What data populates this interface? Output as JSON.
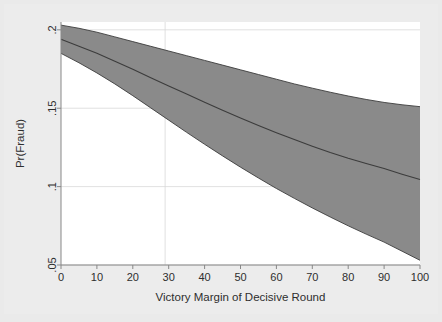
{
  "figure": {
    "background_color": "#ececec",
    "plot_background_color": "#ffffff",
    "band_fill_color": "#8a8a8a",
    "line_color": "#3c3c3c",
    "axis_color": "#888888",
    "gridline_color": "#d8d8d8"
  },
  "chart_data": {
    "type": "line",
    "title": "",
    "subtitle": "",
    "xlabel": "Victory Margin of Decisive Round",
    "ylabel": "Pr(Fraud)",
    "xlim": [
      0,
      100
    ],
    "ylim": [
      0.05,
      0.205
    ],
    "xticks": [
      0,
      10,
      20,
      30,
      40,
      50,
      60,
      70,
      80,
      90,
      100
    ],
    "xticklabels": [
      "0",
      "10",
      "20",
      "30",
      "40",
      "50",
      "60",
      "70",
      "80",
      "90",
      "100"
    ],
    "yticks": [
      0.05,
      0.1,
      0.15,
      0.2
    ],
    "yticklabels": [
      ".05",
      ".1",
      ".15",
      ".2"
    ],
    "grid": "light horizontal gridlines at y ticks plus one faint vertical line near x=29",
    "legend": "none",
    "annotations": [],
    "x": [
      0,
      5,
      10,
      15,
      20,
      25,
      30,
      35,
      40,
      45,
      50,
      55,
      60,
      65,
      70,
      75,
      80,
      85,
      90,
      95,
      100
    ],
    "series": [
      {
        "name": "Upper 95% CI",
        "values": [
          0.203,
          0.201,
          0.1985,
          0.1955,
          0.1925,
          0.1895,
          0.1865,
          0.1835,
          0.1805,
          0.1775,
          0.1745,
          0.1715,
          0.1685,
          0.1655,
          0.1628,
          0.1602,
          0.1578,
          0.1556,
          0.1537,
          0.1522,
          0.151
        ]
      },
      {
        "name": "Predicted Pr(Fraud)",
        "values": [
          0.194,
          0.1895,
          0.185,
          0.18,
          0.1748,
          0.1695,
          0.1642,
          0.159,
          0.1538,
          0.1487,
          0.1438,
          0.139,
          0.1344,
          0.13,
          0.1258,
          0.1218,
          0.1181,
          0.1147,
          0.1115,
          0.1079,
          0.1045
        ]
      },
      {
        "name": "Lower 95% CI",
        "values": [
          0.185,
          0.179,
          0.1725,
          0.1655,
          0.158,
          0.1502,
          0.1424,
          0.1346,
          0.127,
          0.1196,
          0.1124,
          0.1055,
          0.0988,
          0.0925,
          0.0864,
          0.0806,
          0.075,
          0.0697,
          0.0646,
          0.0588,
          0.053
        ]
      }
    ]
  }
}
